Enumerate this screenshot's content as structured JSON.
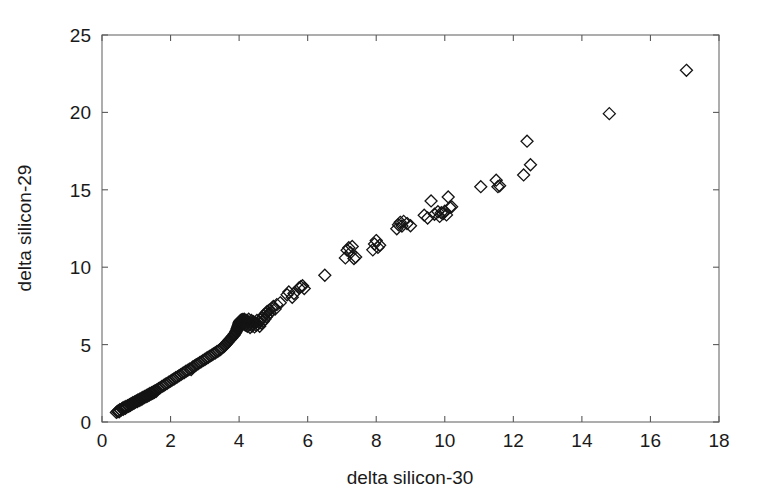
{
  "chart_data": {
    "type": "scatter",
    "title": "",
    "xlabel": "delta silicon-30",
    "ylabel": "delta silicon-29",
    "xlim": [
      0,
      18
    ],
    "ylim": [
      0,
      25
    ],
    "xticks": [
      0,
      2,
      4,
      6,
      8,
      10,
      12,
      14,
      16,
      18
    ],
    "yticks": [
      0,
      5,
      10,
      15,
      20,
      25
    ],
    "xtick_labels": [
      "0",
      "2",
      "4",
      "6",
      "8",
      "10",
      "12",
      "14",
      "16",
      "18"
    ],
    "ytick_labels": [
      "0",
      "5",
      "10",
      "15",
      "20",
      "25"
    ],
    "grid": false,
    "legend": null,
    "marker": "diamond-open",
    "marker_color": "#141414",
    "marker_size": 9,
    "axis_color": "#6b6b6b",
    "background_color": "#ffffff",
    "series": [
      {
        "name": "silicon isotope samples",
        "points": [
          [
            0.42,
            0.62
          ],
          [
            0.45,
            0.68
          ],
          [
            0.48,
            0.72
          ],
          [
            0.5,
            0.66
          ],
          [
            0.52,
            0.8
          ],
          [
            0.55,
            0.75
          ],
          [
            0.58,
            0.85
          ],
          [
            0.6,
            0.9
          ],
          [
            0.62,
            0.82
          ],
          [
            0.65,
            0.95
          ],
          [
            0.68,
            0.88
          ],
          [
            0.7,
            1.0
          ],
          [
            0.72,
            0.96
          ],
          [
            0.75,
            1.05
          ],
          [
            0.78,
            1.02
          ],
          [
            0.8,
            1.12
          ],
          [
            0.83,
            1.08
          ],
          [
            0.85,
            1.18
          ],
          [
            0.88,
            1.15
          ],
          [
            0.9,
            1.25
          ],
          [
            0.93,
            1.2
          ],
          [
            0.95,
            1.3
          ],
          [
            0.98,
            1.28
          ],
          [
            1.0,
            1.36
          ],
          [
            1.03,
            1.32
          ],
          [
            1.05,
            1.42
          ],
          [
            1.08,
            1.38
          ],
          [
            1.1,
            1.48
          ],
          [
            1.13,
            1.44
          ],
          [
            1.15,
            1.54
          ],
          [
            1.18,
            1.5
          ],
          [
            1.2,
            1.6
          ],
          [
            1.23,
            1.57
          ],
          [
            1.25,
            1.66
          ],
          [
            1.28,
            1.62
          ],
          [
            1.3,
            1.72
          ],
          [
            1.33,
            1.68
          ],
          [
            1.35,
            1.78
          ],
          [
            1.38,
            1.74
          ],
          [
            1.4,
            1.84
          ],
          [
            1.43,
            1.8
          ],
          [
            1.45,
            1.9
          ],
          [
            1.48,
            1.86
          ],
          [
            1.5,
            1.96
          ],
          [
            1.53,
            1.92
          ],
          [
            1.55,
            2.02
          ],
          [
            1.58,
            1.98
          ],
          [
            1.6,
            2.08
          ],
          [
            1.65,
            2.16
          ],
          [
            1.7,
            2.22
          ],
          [
            1.75,
            2.3
          ],
          [
            1.8,
            2.36
          ],
          [
            1.85,
            2.44
          ],
          [
            1.9,
            2.5
          ],
          [
            1.95,
            2.58
          ],
          [
            2.0,
            2.64
          ],
          [
            2.05,
            2.72
          ],
          [
            2.1,
            2.78
          ],
          [
            2.15,
            2.86
          ],
          [
            2.2,
            2.92
          ],
          [
            2.25,
            3.0
          ],
          [
            2.3,
            3.06
          ],
          [
            2.35,
            3.14
          ],
          [
            2.4,
            3.2
          ],
          [
            2.45,
            3.28
          ],
          [
            2.5,
            3.34
          ],
          [
            2.55,
            3.42
          ],
          [
            2.6,
            3.38
          ],
          [
            2.62,
            3.48
          ],
          [
            2.65,
            3.56
          ],
          [
            2.7,
            3.62
          ],
          [
            2.75,
            3.7
          ],
          [
            2.8,
            3.76
          ],
          [
            2.85,
            3.84
          ],
          [
            2.9,
            3.9
          ],
          [
            2.95,
            3.98
          ],
          [
            3.0,
            4.04
          ],
          [
            3.05,
            4.12
          ],
          [
            3.1,
            4.18
          ],
          [
            3.15,
            4.26
          ],
          [
            3.2,
            4.32
          ],
          [
            3.25,
            4.4
          ],
          [
            3.3,
            4.46
          ],
          [
            3.35,
            4.54
          ],
          [
            3.4,
            4.6
          ],
          [
            3.45,
            4.68
          ],
          [
            3.48,
            4.74
          ],
          [
            3.5,
            4.8
          ],
          [
            3.55,
            4.86
          ],
          [
            3.58,
            4.94
          ],
          [
            3.6,
            5.0
          ],
          [
            3.63,
            5.06
          ],
          [
            3.65,
            5.14
          ],
          [
            3.68,
            5.18
          ],
          [
            3.7,
            5.26
          ],
          [
            3.72,
            5.3
          ],
          [
            3.75,
            5.38
          ],
          [
            3.78,
            5.42
          ],
          [
            3.8,
            5.5
          ],
          [
            3.82,
            5.56
          ],
          [
            3.85,
            5.6
          ],
          [
            3.86,
            5.68
          ],
          [
            3.88,
            5.72
          ],
          [
            3.9,
            5.8
          ],
          [
            3.91,
            5.86
          ],
          [
            3.93,
            5.92
          ],
          [
            3.94,
            6.0
          ],
          [
            3.95,
            6.06
          ],
          [
            3.96,
            6.12
          ],
          [
            3.97,
            6.18
          ],
          [
            3.98,
            6.24
          ],
          [
            3.99,
            6.3
          ],
          [
            4.0,
            6.34
          ],
          [
            4.0,
            6.4
          ],
          [
            4.01,
            6.44
          ],
          [
            4.02,
            6.48
          ],
          [
            4.03,
            6.52
          ],
          [
            4.04,
            6.44
          ],
          [
            4.05,
            6.56
          ],
          [
            4.06,
            6.38
          ],
          [
            4.07,
            6.6
          ],
          [
            4.08,
            6.48
          ],
          [
            4.09,
            6.3
          ],
          [
            4.1,
            6.52
          ],
          [
            4.11,
            6.62
          ],
          [
            4.12,
            6.42
          ],
          [
            4.13,
            6.34
          ],
          [
            4.14,
            6.56
          ],
          [
            4.15,
            6.64
          ],
          [
            4.16,
            6.46
          ],
          [
            4.18,
            6.26
          ],
          [
            4.2,
            6.58
          ],
          [
            4.22,
            6.36
          ],
          [
            4.24,
            6.18
          ],
          [
            4.26,
            6.5
          ],
          [
            4.28,
            6.64
          ],
          [
            4.3,
            6.28
          ],
          [
            4.32,
            6.1
          ],
          [
            4.34,
            6.42
          ],
          [
            4.36,
            6.56
          ],
          [
            4.38,
            6.2
          ],
          [
            4.4,
            6.34
          ],
          [
            4.42,
            6.48
          ],
          [
            4.45,
            6.14
          ],
          [
            4.48,
            6.4
          ],
          [
            4.5,
            6.24
          ],
          [
            4.52,
            6.56
          ],
          [
            4.55,
            6.32
          ],
          [
            4.58,
            6.44
          ],
          [
            4.6,
            6.18
          ],
          [
            4.62,
            6.6
          ],
          [
            4.65,
            6.38
          ],
          [
            4.68,
            6.72
          ],
          [
            4.7,
            6.5
          ],
          [
            4.72,
            6.9
          ],
          [
            4.75,
            6.64
          ],
          [
            4.78,
            7.02
          ],
          [
            4.8,
            6.8
          ],
          [
            4.82,
            7.14
          ],
          [
            4.85,
            6.94
          ],
          [
            4.88,
            7.22
          ],
          [
            4.9,
            7.06
          ],
          [
            4.95,
            7.34
          ],
          [
            5.0,
            7.46
          ],
          [
            5.05,
            7.3
          ],
          [
            5.1,
            7.58
          ],
          [
            5.2,
            7.7
          ],
          [
            5.4,
            8.22
          ],
          [
            5.45,
            8.4
          ],
          [
            5.55,
            8.06
          ],
          [
            5.6,
            8.3
          ],
          [
            5.75,
            8.66
          ],
          [
            5.8,
            8.74
          ],
          [
            5.85,
            8.8
          ],
          [
            5.9,
            8.62
          ],
          [
            6.5,
            9.48
          ],
          [
            7.1,
            10.6
          ],
          [
            7.15,
            11.1
          ],
          [
            7.2,
            11.26
          ],
          [
            7.25,
            10.94
          ],
          [
            7.3,
            11.34
          ],
          [
            7.35,
            10.56
          ],
          [
            7.4,
            10.66
          ],
          [
            7.9,
            11.12
          ],
          [
            7.95,
            11.5
          ],
          [
            8.0,
            11.72
          ],
          [
            8.05,
            11.28
          ],
          [
            8.1,
            11.42
          ],
          [
            8.6,
            12.48
          ],
          [
            8.65,
            12.74
          ],
          [
            8.7,
            12.9
          ],
          [
            8.75,
            12.66
          ],
          [
            8.8,
            12.96
          ],
          [
            8.9,
            12.82
          ],
          [
            9.0,
            12.68
          ],
          [
            9.4,
            13.36
          ],
          [
            9.5,
            13.18
          ],
          [
            9.6,
            14.28
          ],
          [
            9.7,
            13.42
          ],
          [
            9.8,
            13.58
          ],
          [
            9.85,
            13.28
          ],
          [
            9.9,
            13.52
          ],
          [
            9.95,
            13.46
          ],
          [
            10.0,
            13.62
          ],
          [
            10.05,
            13.38
          ],
          [
            10.1,
            14.54
          ],
          [
            10.15,
            13.86
          ],
          [
            10.2,
            13.9
          ],
          [
            11.05,
            15.2
          ],
          [
            11.5,
            15.62
          ],
          [
            11.55,
            15.2
          ],
          [
            11.6,
            15.26
          ],
          [
            12.3,
            15.96
          ],
          [
            12.4,
            18.14
          ],
          [
            12.5,
            16.62
          ],
          [
            14.8,
            19.92
          ],
          [
            17.05,
            22.72
          ]
        ]
      }
    ]
  },
  "geometry": {
    "plot_left": 102,
    "plot_right": 719,
    "plot_top": 35,
    "plot_bottom": 422
  }
}
